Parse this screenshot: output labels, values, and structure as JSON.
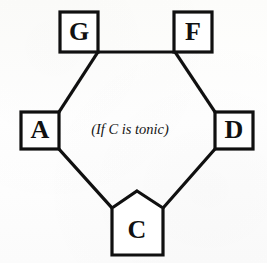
{
  "diagram": {
    "caption": "(If C is tonic)",
    "background_color": "#fdfdfd",
    "line_color": "#101010",
    "shape_fill": "#ffffff",
    "nodes": [
      {
        "id": "G",
        "label": "G",
        "shape": "square",
        "cx": 79,
        "cy": 32
      },
      {
        "id": "F",
        "label": "F",
        "shape": "square",
        "cx": 193,
        "cy": 32
      },
      {
        "id": "A",
        "label": "A",
        "shape": "square",
        "cx": 40,
        "cy": 130
      },
      {
        "id": "D",
        "label": "D",
        "shape": "square",
        "cx": 234,
        "cy": 130
      },
      {
        "id": "C",
        "label": "C",
        "shape": "pentagon",
        "cx": 137,
        "cy": 228
      }
    ],
    "edges": [
      {
        "from": "G",
        "to": "F",
        "kind": "horizontal"
      },
      {
        "from": "G",
        "to": "A",
        "kind": "diagonal"
      },
      {
        "from": "F",
        "to": "D",
        "kind": "diagonal"
      },
      {
        "from": "A",
        "to": "C",
        "kind": "diagonal"
      },
      {
        "from": "D",
        "to": "C",
        "kind": "diagonal"
      }
    ]
  }
}
